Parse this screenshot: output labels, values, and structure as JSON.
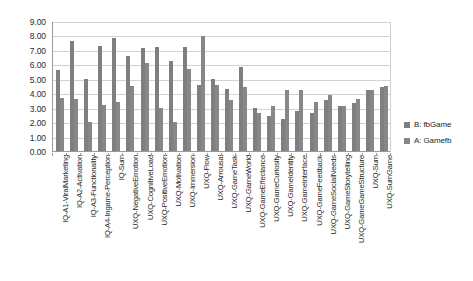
{
  "chart_data": {
    "type": "bar",
    "title": "",
    "subtitle": "",
    "xlabel": "",
    "ylabel": "",
    "ylim": [
      0,
      9
    ],
    "ytick_step": 1,
    "ytick_labels": [
      "0.00",
      "1.00",
      "2.00",
      "3.00",
      "4.00",
      "5.00",
      "6.00",
      "7.00",
      "8.00",
      "9.00"
    ],
    "grid": true,
    "legend_position": "right",
    "bar_color": "#7f7f7f",
    "categories": [
      "IQ-A1-ViralMarketing",
      "IQ-A2-Activation",
      "IQ-A3-Functionality",
      "IQ-A4-Ingame-Perception",
      "IQ-Sum",
      "UXQ-NegativeEmotion",
      "UXQ-CognitiveLoad",
      "UXQ-PositiveEmotion",
      "UXQ-Motivation",
      "UXQ-Immersion",
      "UXQ-Flow",
      "UXQ-Arrousal",
      "UXQ-GameTask",
      "UXQ-GameWorld",
      "UXQ-GameEffectance",
      "UXQ-GameCuriosity",
      "UXQ-GameIdentity",
      "UXQ-GameInterface",
      "UXQ-GameFeedback",
      "UXQ-GameSocialNeeds",
      "UXQ-GameStorytelling",
      "UXQ-GameGameStructure",
      "UXQ-Sum",
      "UXQ-SumGame"
    ],
    "series": [
      {
        "name": "B: fbGame",
        "color": "#7f7f7f",
        "values": [
          5.6,
          7.65,
          5.0,
          7.3,
          7.8,
          6.55,
          7.1,
          7.2,
          6.2,
          7.2,
          4.6,
          5.0,
          4.3,
          5.85,
          2.95,
          2.45,
          2.25,
          2.8,
          2.6,
          3.5,
          3.1,
          3.3,
          4.25,
          4.4
        ]
      },
      {
        "name": "A: Gamefb",
        "color": "#878787",
        "values": [
          3.7,
          3.6,
          2.0,
          3.2,
          3.4,
          4.5,
          6.1,
          3.0,
          2.0,
          5.7,
          7.95,
          4.6,
          3.55,
          4.4,
          2.6,
          3.15,
          4.25,
          4.25,
          3.4,
          3.9,
          3.15,
          3.6,
          4.2,
          4.5
        ]
      }
    ],
    "legend": [
      {
        "label": "B: fbGame",
        "color": "#7f7f7f"
      },
      {
        "label": "A: Gamefb",
        "color": "#878787"
      }
    ]
  }
}
